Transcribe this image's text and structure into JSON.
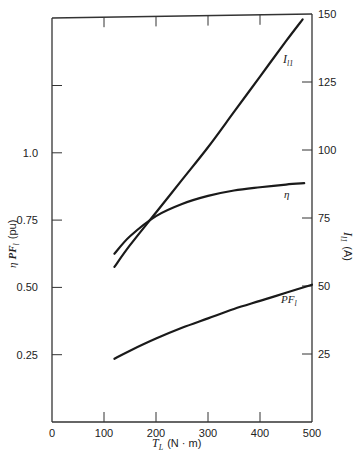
{
  "chart_data": {
    "type": "line",
    "title": "",
    "xlabel": "T_L (N · m)",
    "xlabel_main": "T",
    "xlabel_sub": "L",
    "xlabel_units": "(N · m)",
    "ylabel_left": "η PF_l (pu)",
    "ylabel_left_eta": "η",
    "ylabel_left_pf": "PF",
    "ylabel_left_sub": "l",
    "ylabel_left_units": "(pu)",
    "ylabel_right": "I_l1 (A)",
    "ylabel_right_main": "I",
    "ylabel_right_sub": "l1",
    "ylabel_right_units": "(A)",
    "xlim": [
      0,
      500
    ],
    "ylim_left": [
      0,
      1.5
    ],
    "ylim_right": [
      0,
      150
    ],
    "x_ticks": [
      "0",
      "100",
      "200",
      "300",
      "400",
      "500"
    ],
    "y_left_ticks": [
      "0.25",
      "0.50",
      "0.75",
      "1.0"
    ],
    "y_right_ticks": [
      "25",
      "50",
      "75",
      "100",
      "125",
      "150"
    ],
    "grid": false,
    "legend": "inline curve labels",
    "series": [
      {
        "name": "I_l1",
        "label_main": "I",
        "label_sub": "l1",
        "axis": "right",
        "x": [
          120,
          150,
          200,
          250,
          300,
          350,
          400,
          450,
          482
        ],
        "values": [
          57,
          65,
          77,
          89,
          101,
          114,
          127,
          140,
          148
        ]
      },
      {
        "name": "η",
        "label_main": "η",
        "axis": "left",
        "x": [
          120,
          150,
          200,
          250,
          300,
          350,
          400,
          450,
          485
        ],
        "values": [
          0.625,
          0.69,
          0.765,
          0.81,
          0.84,
          0.86,
          0.872,
          0.882,
          0.887
        ]
      },
      {
        "name": "PF_l",
        "label_main": "PF",
        "label_sub": "l",
        "axis": "left",
        "x": [
          120,
          150,
          200,
          250,
          300,
          350,
          400,
          450,
          500
        ],
        "values": [
          0.235,
          0.265,
          0.31,
          0.35,
          0.385,
          0.42,
          0.45,
          0.48,
          0.51
        ]
      }
    ]
  }
}
